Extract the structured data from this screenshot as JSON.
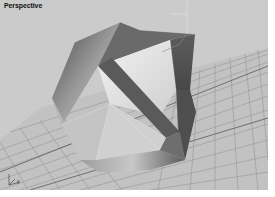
{
  "viewport": {
    "label": "Perspective",
    "background": "#c9c9c9",
    "grid_color": "#8a8a8a",
    "grid_major_color": "#555555",
    "object": "icosahedron-like polyhedron",
    "axis_tripod": {
      "x": "x",
      "y": "y",
      "z": "z"
    }
  }
}
